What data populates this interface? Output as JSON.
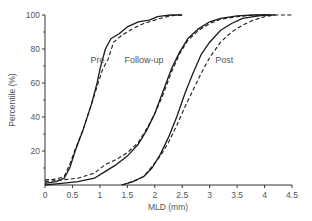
{
  "chart_data": {
    "type": "line",
    "title": "",
    "xlabel": "MLD (mm)",
    "ylabel": "Percentile (%)",
    "xlim": [
      0,
      4.5
    ],
    "ylim": [
      0,
      100
    ],
    "xticks": [
      0,
      0.5,
      1,
      1.5,
      2,
      2.5,
      3,
      3.5,
      4,
      4.5
    ],
    "xtick_labels": [
      "0",
      "0.5",
      "1",
      "1.5",
      "2",
      "2.5",
      "3",
      "3.5",
      "4",
      "4.5"
    ],
    "yticks": [
      20,
      40,
      60,
      80,
      100
    ],
    "ytick_labels": [
      "20",
      "40",
      "60",
      "80",
      "100"
    ],
    "grid": false,
    "legend": null,
    "annotations": [
      {
        "text": "Pre",
        "x": 0.83,
        "y": 72
      },
      {
        "text": "Follow-up",
        "x": 1.45,
        "y": 72
      },
      {
        "text": "Post",
        "x": 3.1,
        "y": 72
      }
    ],
    "series": [
      {
        "name": "Pre (series A)",
        "group": "Pre",
        "style": "solid",
        "x": [
          0,
          0.2,
          0.35,
          0.45,
          0.55,
          0.7,
          0.85,
          0.95,
          1.0,
          1.1,
          1.2,
          1.35,
          1.5,
          1.7,
          1.9,
          2.05,
          2.15,
          2.3,
          2.5
        ],
        "y": [
          1,
          2,
          4,
          10,
          20,
          33,
          48,
          60,
          68,
          80,
          86,
          89,
          93,
          96,
          97,
          99,
          99.5,
          100,
          100
        ]
      },
      {
        "name": "Pre (series B)",
        "group": "Pre",
        "style": "dashed",
        "x": [
          0,
          0.2,
          0.35,
          0.45,
          0.55,
          0.7,
          0.85,
          0.95,
          1.05,
          1.15,
          1.25,
          1.4,
          1.6,
          1.8,
          2.0,
          2.15,
          2.3,
          2.5
        ],
        "y": [
          3,
          3.5,
          5,
          12,
          21,
          33,
          48,
          58,
          68,
          74,
          84,
          88,
          92,
          95,
          97,
          98.5,
          99.5,
          100
        ]
      },
      {
        "name": "Follow-up (series A)",
        "group": "Follow-up",
        "style": "solid",
        "x": [
          0,
          0.3,
          0.6,
          0.9,
          1.1,
          1.3,
          1.5,
          1.7,
          1.85,
          2.0,
          2.15,
          2.3,
          2.45,
          2.6,
          2.8,
          3.0,
          3.2,
          3.5,
          3.8,
          4.1
        ],
        "y": [
          0,
          1,
          2,
          4,
          8,
          12,
          17,
          24,
          32,
          42,
          55,
          68,
          78,
          86,
          92,
          96,
          98,
          99.5,
          100,
          100
        ]
      },
      {
        "name": "Follow-up (series B)",
        "group": "Follow-up",
        "style": "dashed",
        "x": [
          0,
          0.3,
          0.6,
          0.9,
          1.1,
          1.3,
          1.5,
          1.7,
          1.85,
          2.0,
          2.15,
          2.3,
          2.45,
          2.6,
          2.8,
          3.0,
          3.2,
          3.5,
          3.8,
          4.1
        ],
        "y": [
          2,
          3,
          4,
          7,
          12,
          15,
          19,
          25,
          33,
          42,
          53,
          66,
          77,
          85,
          91,
          95,
          97.5,
          99,
          100,
          100
        ]
      },
      {
        "name": "Post (series A)",
        "group": "Post",
        "style": "solid",
        "x": [
          1.4,
          1.6,
          1.8,
          1.95,
          2.1,
          2.25,
          2.4,
          2.55,
          2.7,
          2.85,
          3.0,
          3.2,
          3.4,
          3.6,
          3.8,
          4.0,
          4.2
        ],
        "y": [
          0,
          2,
          5,
          10,
          18,
          28,
          40,
          54,
          66,
          77,
          84,
          91,
          95,
          98,
          99,
          100,
          100
        ]
      },
      {
        "name": "Post (series B)",
        "group": "Post",
        "style": "dashed",
        "x": [
          1.4,
          1.6,
          1.8,
          1.95,
          2.1,
          2.25,
          2.4,
          2.55,
          2.7,
          2.85,
          3.0,
          3.2,
          3.4,
          3.6,
          3.8,
          4.0,
          4.2,
          4.5
        ],
        "y": [
          0,
          2,
          5,
          11,
          17,
          25,
          35,
          46,
          56,
          66,
          75,
          84,
          90,
          94,
          97,
          99,
          100,
          100
        ]
      }
    ]
  },
  "colors": {
    "line": "#1a1a1a",
    "axis": "#333333",
    "text": "#555555",
    "background": "#ffffff"
  }
}
